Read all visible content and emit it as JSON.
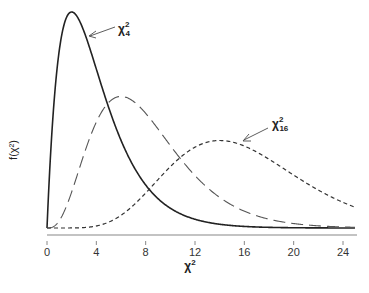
{
  "chart_data": {
    "type": "line",
    "title": "",
    "xlabel": "χ²",
    "ylabel": "f(χ²)",
    "xlim": [
      0,
      25
    ],
    "x_ticks": [
      0,
      4,
      8,
      12,
      16,
      20,
      24
    ],
    "x_tick_labels": [
      "0",
      "4",
      "8",
      "12",
      "16",
      "20",
      "24"
    ],
    "y_ticks": [],
    "grid": false,
    "legend": "none (curves annotated inline)",
    "series": [
      {
        "name": "χ²₄",
        "df": 4,
        "style": "solid",
        "mode_x": 2,
        "annotated": true
      },
      {
        "name": "χ²₈",
        "df": 8,
        "style": "long-dash",
        "mode_x": 6,
        "annotated": false
      },
      {
        "name": "χ²₁₆",
        "df": 16,
        "style": "short-dash",
        "mode_x": 14,
        "annotated": true
      }
    ],
    "annotations": [
      {
        "text_base": "χ",
        "sup": "2",
        "sub": "4",
        "points_to_series": "χ²₄"
      },
      {
        "text_base": "χ",
        "sup": "2",
        "sub": "16",
        "points_to_series": "χ²₁₆"
      }
    ]
  },
  "labels": {
    "xlabel_base": "χ",
    "xlabel_sup": "2",
    "ylabel": "f(χ²)",
    "annot1_base": "χ",
    "annot1_sup": "2",
    "annot1_sub": "4",
    "annot2_base": "χ",
    "annot2_sup": "2",
    "annot2_sub": "16"
  }
}
